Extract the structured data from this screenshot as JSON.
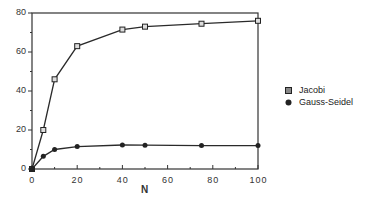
{
  "chart_data": {
    "type": "line",
    "title": "",
    "xlabel": "N",
    "ylabel": "",
    "xlim": [
      0,
      100
    ],
    "ylim": [
      0,
      80
    ],
    "x_ticks": [
      0,
      20,
      40,
      60,
      80,
      100
    ],
    "y_ticks": [
      0,
      20,
      40,
      60,
      80
    ],
    "grid": false,
    "legend_position": "right",
    "x": [
      0,
      5,
      10,
      20,
      40,
      50,
      75,
      100
    ],
    "series": [
      {
        "name": "Jacobi",
        "marker": "open-square",
        "values": [
          0,
          20,
          46,
          63,
          71.5,
          73,
          74.5,
          76
        ]
      },
      {
        "name": "Gauss-Seidel",
        "marker": "filled-circle",
        "values": [
          0,
          6.5,
          10,
          11.5,
          12.3,
          12.2,
          12,
          12
        ]
      }
    ]
  },
  "legend": {
    "items": [
      {
        "label": "Jacobi"
      },
      {
        "label": "Gauss-Seidel"
      }
    ]
  },
  "colors": {
    "line": "#2a2a2a",
    "axis": "#333333"
  }
}
